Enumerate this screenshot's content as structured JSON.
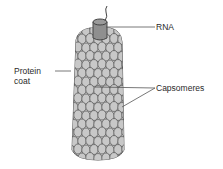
{
  "diagram": {
    "labels": {
      "rna": "RNA",
      "protein_line1": "Protein",
      "protein_line2": "coat",
      "capsomeres": "Capsomeres"
    },
    "colors": {
      "capsomere_fill": "#c8c8c8",
      "capsomere_stroke": "#555555",
      "rna_cap_fill": "#8f8f8f",
      "leader_line": "#555555",
      "text": "#2a2a2a",
      "background": "#ffffff"
    }
  }
}
